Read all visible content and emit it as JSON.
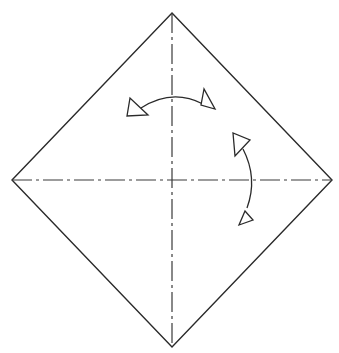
{
  "diagram": {
    "type": "origami-fold-diagram",
    "colors": {
      "background": "#ffffff",
      "line": "#2a2a2a",
      "arrow_fill": "#ffffff"
    },
    "paper": {
      "shape": "diamond",
      "vertices": {
        "top": [
          172,
          13
        ],
        "right": [
          332,
          180
        ],
        "bottom": [
          172,
          347
        ],
        "left": [
          12,
          180
        ]
      }
    },
    "creases": [
      {
        "name": "vertical-diagonal",
        "style": "dash-dot",
        "from": [
          172,
          13
        ],
        "to": [
          172,
          347
        ]
      },
      {
        "name": "horizontal-diagonal",
        "style": "dash-dot",
        "from": [
          12,
          180
        ],
        "to": [
          332,
          180
        ]
      }
    ],
    "arrows": [
      {
        "name": "top-curved-arrow",
        "path": "M 203 104 Q 172 88 141 108",
        "heads": [
          {
            "name": "left-head",
            "points": "130,98 127,116 148,115"
          },
          {
            "name": "right-head",
            "points": "204,89 201,105 215,109"
          }
        ]
      },
      {
        "name": "right-curved-arrow",
        "path": "M 243 149 Q 258 178 247 208",
        "heads": [
          {
            "name": "upper-head",
            "points": "233,133 235,156 250,140"
          },
          {
            "name": "lower-head",
            "points": "245,211 239,225 253,220"
          }
        ]
      }
    ]
  }
}
